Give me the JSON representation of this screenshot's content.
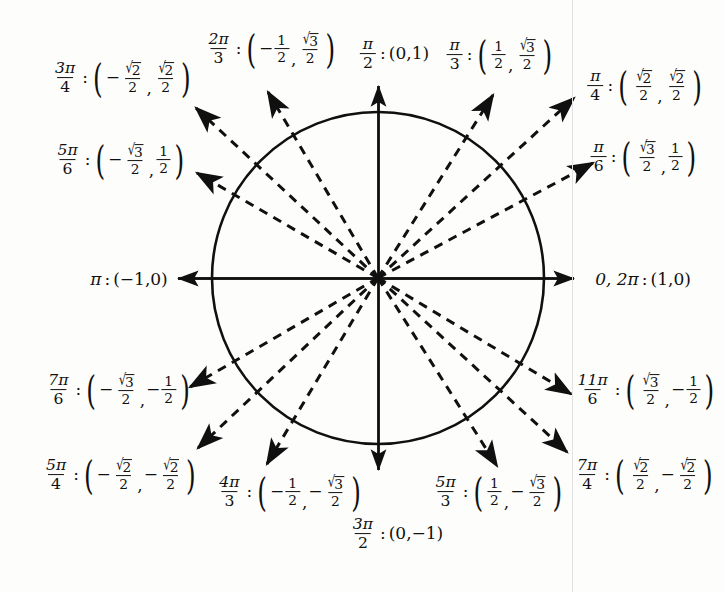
{
  "diagram": {
    "type": "unit-circle-reference",
    "background_color": "#fdfdfb",
    "ink_color": "#101010",
    "circle": {
      "center_x": 378,
      "center_y": 278,
      "radius": 166
    },
    "axes": {
      "x_left_tip": 178,
      "x_right_tip": 574,
      "y_top_tip": 86,
      "y_bottom_tip": 470,
      "style": "solid-with-arrowheads"
    },
    "ray_style": "dashed-with-arrowheads",
    "scan_edge_x": 572
  },
  "points": [
    {
      "id": "angle-0-2pi",
      "angle_deg": 0,
      "angle_text": "0, 2π",
      "angle_kind": "inline",
      "coords": {
        "x": "(1,0)",
        "x_num": 1,
        "y_num": 0
      },
      "coord_kind": "plain",
      "coord_text": "(1,0)",
      "label_center": {
        "x": 643,
        "y": 279
      },
      "on_axis": true,
      "ray": null
    },
    {
      "id": "angle-pi-over-6",
      "angle_deg": 30,
      "angle_num": "π",
      "angle_den": "6",
      "angle_kind": "fraction",
      "coords": {
        "x": "√3/2",
        "y": "1/2"
      },
      "coord_kind": "frac-frac",
      "x_sign": "",
      "x_num_radical": "3",
      "x_den": "2",
      "y_sign": "",
      "y_num": "1",
      "y_den": "2",
      "label_center": {
        "x": 644,
        "y": 157
      },
      "on_axis": false,
      "ray": {
        "tip_x": 593,
        "tip_y": 163
      }
    },
    {
      "id": "angle-pi-over-4",
      "angle_deg": 45,
      "angle_num": "π",
      "angle_den": "4",
      "angle_kind": "fraction",
      "coords": {
        "x": "√2/2",
        "y": "√2/2"
      },
      "coord_kind": "frac-frac",
      "x_sign": "",
      "x_num_radical": "2",
      "x_den": "2",
      "y_sign": "",
      "y_num_radical": "2",
      "y_den": "2",
      "label_center": {
        "x": 645,
        "y": 86
      },
      "on_axis": false,
      "ray": {
        "tip_x": 574,
        "tip_y": 98
      }
    },
    {
      "id": "angle-pi-over-3",
      "angle_deg": 60,
      "angle_num": "π",
      "angle_den": "3",
      "angle_kind": "fraction",
      "coords": {
        "x": "1/2",
        "y": "√3/2"
      },
      "coord_kind": "frac-frac",
      "x_sign": "",
      "x_num": "1",
      "x_den": "2",
      "y_sign": "",
      "y_num_radical": "3",
      "y_den": "2",
      "label_center": {
        "x": 500,
        "y": 55
      },
      "on_axis": false,
      "ray": {
        "tip_x": 493,
        "tip_y": 95
      }
    },
    {
      "id": "angle-pi-over-2",
      "angle_deg": 90,
      "angle_num": "π",
      "angle_den": "2",
      "angle_kind": "fraction",
      "coords": {
        "x": "(0,1)"
      },
      "coord_kind": "plain",
      "coord_text": "(0,1)",
      "label_center": {
        "x": 394,
        "y": 54
      },
      "on_axis": true,
      "ray": null
    },
    {
      "id": "angle-2pi-over-3",
      "angle_deg": 120,
      "angle_num": "2π",
      "angle_den": "3",
      "angle_kind": "fraction",
      "coords": {
        "x": "-1/2",
        "y": "√3/2"
      },
      "coord_kind": "frac-frac",
      "x_sign": "−",
      "x_num": "1",
      "x_den": "2",
      "y_sign": "",
      "y_num_radical": "3",
      "y_den": "2",
      "label_center": {
        "x": 271,
        "y": 49
      },
      "on_axis": false,
      "ray": {
        "tip_x": 268,
        "tip_y": 92
      }
    },
    {
      "id": "angle-3pi-over-4",
      "angle_deg": 135,
      "angle_num": "3π",
      "angle_den": "4",
      "angle_kind": "fraction",
      "coords": {
        "x": "-√2/2",
        "y": "√2/2"
      },
      "coord_kind": "frac-frac",
      "x_sign": "−",
      "x_num_radical": "2",
      "x_den": "2",
      "y_sign": "",
      "y_num_radical": "2",
      "y_den": "2",
      "label_center": {
        "x": 122,
        "y": 78
      },
      "on_axis": false,
      "ray": {
        "tip_x": 196,
        "tip_y": 108
      }
    },
    {
      "id": "angle-5pi-over-6",
      "angle_deg": 150,
      "angle_num": "5π",
      "angle_den": "6",
      "angle_kind": "fraction",
      "coords": {
        "x": "-√3/2",
        "y": "1/2"
      },
      "coord_kind": "frac-frac",
      "x_sign": "−",
      "x_num_radical": "3",
      "x_den": "2",
      "y_sign": "",
      "y_num": "1",
      "y_den": "2",
      "label_center": {
        "x": 120,
        "y": 160
      },
      "on_axis": false,
      "ray": {
        "tip_x": 197,
        "tip_y": 173
      }
    },
    {
      "id": "angle-pi",
      "angle_deg": 180,
      "angle_text": "π",
      "angle_kind": "inline",
      "coords": {
        "x": "(-1,0)"
      },
      "coord_kind": "plain",
      "coord_text": "(−1,0)",
      "label_center": {
        "x": 129,
        "y": 279
      },
      "on_axis": true,
      "ray": null
    },
    {
      "id": "angle-7pi-over-6",
      "angle_deg": 210,
      "angle_num": "7π",
      "angle_den": "6",
      "angle_kind": "fraction",
      "coords": {
        "x": "-√3/2",
        "y": "-1/2"
      },
      "coord_kind": "frac-frac",
      "x_sign": "−",
      "x_num_radical": "3",
      "x_den": "2",
      "y_sign": "−",
      "y_num": "1",
      "y_den": "2",
      "label_center": {
        "x": 118,
        "y": 390
      },
      "on_axis": false,
      "ray": {
        "tip_x": 190,
        "tip_y": 387
      }
    },
    {
      "id": "angle-5pi-over-4",
      "angle_deg": 225,
      "angle_num": "5π",
      "angle_den": "4",
      "angle_kind": "fraction",
      "coords": {
        "x": "-√2/2",
        "y": "-√2/2"
      },
      "coord_kind": "frac-frac",
      "x_sign": "−",
      "x_num_radical": "2",
      "x_den": "2",
      "y_sign": "−",
      "y_num_radical": "2",
      "y_den": "2",
      "label_center": {
        "x": 120,
        "y": 475
      },
      "on_axis": false,
      "ray": {
        "tip_x": 198,
        "tip_y": 448
      }
    },
    {
      "id": "angle-4pi-over-3",
      "angle_deg": 240,
      "angle_num": "4π",
      "angle_den": "3",
      "angle_kind": "fraction",
      "coords": {
        "x": "-1/2",
        "y": "-√3/2"
      },
      "coord_kind": "frac-frac",
      "x_sign": "−",
      "x_num": "1",
      "x_den": "2",
      "y_sign": "−",
      "y_num_radical": "3",
      "y_den": "2",
      "label_center": {
        "x": 289,
        "y": 492
      },
      "on_axis": false,
      "ray": {
        "tip_x": 267,
        "tip_y": 464
      }
    },
    {
      "id": "angle-3pi-over-2",
      "angle_deg": 270,
      "angle_num": "3π",
      "angle_den": "2",
      "angle_kind": "fraction",
      "coords": {
        "x": "(0,-1)"
      },
      "coord_kind": "plain",
      "coord_text": "(0,−1)",
      "label_center": {
        "x": 396,
        "y": 534
      },
      "on_axis": true,
      "ray": null
    },
    {
      "id": "angle-5pi-over-3",
      "angle_deg": 300,
      "angle_num": "5π",
      "angle_den": "3",
      "angle_kind": "fraction",
      "coords": {
        "x": "1/2",
        "y": "-√3/2"
      },
      "coord_kind": "frac-frac",
      "x_sign": "",
      "x_num": "1",
      "x_den": "2",
      "y_sign": "−",
      "y_num_radical": "3",
      "y_den": "2",
      "label_center": {
        "x": 498,
        "y": 492
      },
      "on_axis": false,
      "ray": {
        "tip_x": 497,
        "tip_y": 466
      }
    },
    {
      "id": "angle-7pi-over-4",
      "angle_deg": 315,
      "angle_num": "7π",
      "angle_den": "4",
      "angle_kind": "fraction",
      "coords": {
        "x": "√2/2",
        "y": "-√2/2"
      },
      "coord_kind": "frac-frac",
      "x_sign": "",
      "x_num_radical": "2",
      "x_den": "2",
      "y_sign": "−",
      "y_num_radical": "2",
      "y_den": "2",
      "label_center": {
        "x": 644,
        "y": 475
      },
      "on_axis": false,
      "ray": {
        "tip_x": 567,
        "tip_y": 452
      }
    },
    {
      "id": "angle-11pi-over-6",
      "angle_deg": 330,
      "angle_num": "11π",
      "angle_den": "6",
      "angle_kind": "fraction",
      "coords": {
        "x": "√3/2",
        "y": "-1/2"
      },
      "coord_kind": "frac-frac",
      "x_sign": "",
      "x_num_radical": "3",
      "x_den": "2",
      "y_sign": "−",
      "y_num": "1",
      "y_den": "2",
      "label_center": {
        "x": 645,
        "y": 390
      },
      "on_axis": false,
      "ray": {
        "tip_x": 571,
        "tip_y": 394
      }
    }
  ]
}
